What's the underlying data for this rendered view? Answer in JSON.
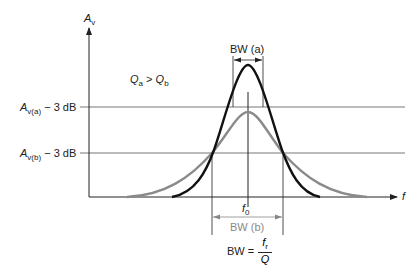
{
  "diagram": {
    "title": "",
    "axes": {
      "y_label": "A",
      "y_label_sub": "v",
      "x_label": "f"
    },
    "condition": {
      "left": "Q",
      "left_sub": "a",
      "op": " > ",
      "right": "Q",
      "right_sub": "b"
    },
    "levels": [
      {
        "name": "A",
        "sub": "v(a)",
        "suffix": " − 3 dB"
      },
      {
        "name": "A",
        "sub": "v(b)",
        "suffix": " − 3 dB"
      }
    ],
    "center": {
      "name": "f",
      "sub": "0"
    },
    "bandwidths": [
      {
        "label": "BW (a)",
        "color": "#222222"
      },
      {
        "label": "BW (b)",
        "color": "#888888"
      }
    ],
    "formula": {
      "lhs": "BW =",
      "num": "f",
      "num_sub": "r",
      "den": "Q"
    },
    "curves": [
      {
        "name": "Q(a) high-Q response",
        "color": "#111111"
      },
      {
        "name": "Q(b) low-Q response",
        "color": "#8a8a8a"
      }
    ],
    "colors": {
      "axis": "#222222",
      "guide": "#777777",
      "curve_a": "#111111",
      "curve_b": "#8a8a8a"
    }
  }
}
